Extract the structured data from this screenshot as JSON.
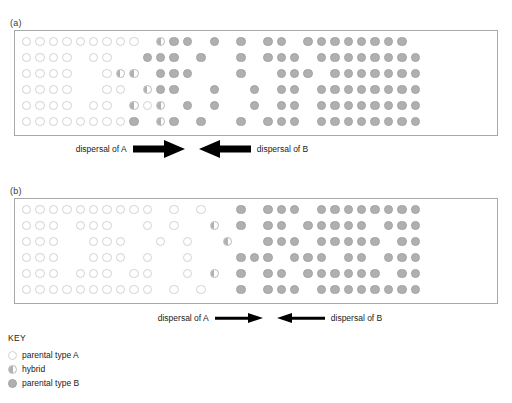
{
  "figure": {
    "panels": [
      {
        "label": "(a)",
        "label_x": 10,
        "label_y": 18,
        "box": {
          "x": 14,
          "y": 30,
          "w": 484,
          "h": 106
        },
        "dispersal": {
          "left_label": "dispersal of A",
          "right_label": "dispersal of B",
          "arrow_weight": "thick",
          "row_x": 62,
          "row_y": 142,
          "row_w": 260
        },
        "grid": {
          "cols": 30,
          "rows": 6,
          "cell": 13.4,
          "dot": 9.4,
          "origin_x": 21,
          "origin_y": 36,
          "row_offsets": [
            0,
            0,
            0,
            0,
            0,
            0
          ],
          "types": [
            "AAAAAAAAA.HBB.B.B.BB.BBBBBBBB",
            "AAAA.AA..BBB.B..B.BBB.BBBBBBBB",
            "AAAA..AHH.BBB...B..BBB.BBBBBBB",
            "AAAA..AA.HBB..B..B.BB.BBBBBBBB",
            "AAAA.AA.HAH.B.B..B.BB.BBBBBBBB",
            "AAAAAAAAB.HB.B..B.BBB.BBBBBBBB"
          ]
        }
      },
      {
        "label": "(b)",
        "label_x": 10,
        "label_y": 186,
        "box": {
          "x": 14,
          "y": 198,
          "w": 484,
          "h": 106
        },
        "dispersal": {
          "left_label": "dispersal of A",
          "right_label": "dispersal of B",
          "arrow_weight": "thin",
          "row_x": 150,
          "row_y": 312,
          "row_w": 240
        },
        "grid": {
          "cols": 30,
          "rows": 6,
          "cell": 13.4,
          "dot": 9.4,
          "origin_x": 21,
          "origin_y": 204,
          "row_offsets": [
            0,
            0,
            0,
            0,
            0,
            0
          ],
          "types": [
            "AAAAAAAAAA.A.A..B.BBB.BBBBBBBB",
            "AAA.AAA..A.A..H.B.BB.BBBBB.BBB",
            "AAA..AAA..A.A..H..BBB.BBBBB.BB",
            "AAA..AAA.A..A...BBB.BBB.BB.BBB",
            "AAA.AAA.AA..A.H.B.BB.BBBBBB.BB",
            "AAAAAAAAAA.A.A..B.BBB.BBBBBBBB"
          ]
        }
      }
    ]
  },
  "key": {
    "title": "KEY",
    "items": [
      {
        "symbol": "A",
        "label": "parental type A"
      },
      {
        "symbol": "H",
        "label": "hybrid"
      },
      {
        "symbol": "B",
        "label": "parental type B"
      }
    ]
  },
  "colors": {
    "parental_a_fill": "#ffffff",
    "parental_a_stroke": "#d2d2d2",
    "parental_b_fill": "#b0b0b0",
    "parental_b_stroke": "#a3a3a3",
    "hybrid_fill": "#b0b0b0",
    "panel_border": "#a8a8a8",
    "arrow": "#000000",
    "text": "#1a1a1a"
  }
}
